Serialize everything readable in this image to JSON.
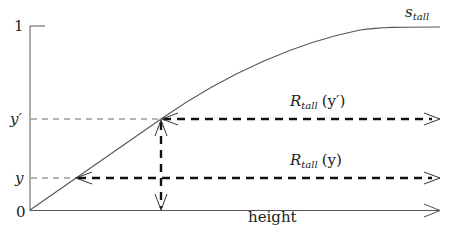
{
  "diagram": {
    "type": "function-plot",
    "curve_label": {
      "main": "s",
      "sub": "tall"
    },
    "x_axis": {
      "label": "height"
    },
    "y_axis": {
      "ticks": [
        {
          "label": "1",
          "value": 1
        },
        {
          "label": "y′",
          "value": 0.49
        },
        {
          "label": "y",
          "value": 0.17
        },
        {
          "label": "0",
          "value": 0
        }
      ]
    },
    "range_labels": [
      {
        "main": "R",
        "sub": "tall",
        "arg": "(y′)"
      },
      {
        "main": "R",
        "sub": "tall",
        "arg": "(y)"
      }
    ],
    "colors": {
      "line": "#555555",
      "thick_dash": "#111111",
      "thin_dash": "#666666",
      "text": "#222222"
    }
  }
}
